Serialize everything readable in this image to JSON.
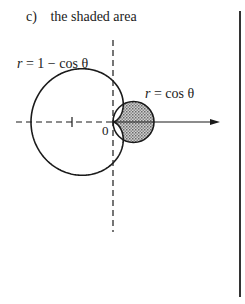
{
  "problem": {
    "part_letter": "c)",
    "part_text": "the shaded area"
  },
  "diagram": {
    "large_curve_label": {
      "lhs": "r",
      "rhs": "= 1 − cos θ"
    },
    "small_curve_label": {
      "lhs": "r",
      "rhs": "= cos θ"
    },
    "origin_label": "0",
    "origin": [
      113,
      122
    ],
    "scale_a_px": 41,
    "shade_color": "#b8b8b8",
    "line_color": "#1a1a1a"
  }
}
